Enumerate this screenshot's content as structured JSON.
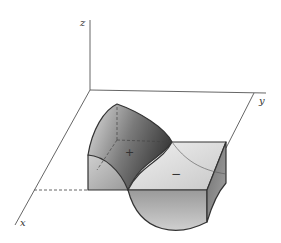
{
  "figure": {
    "axes": {
      "x_label": "x",
      "y_label": "y",
      "z_label": "z"
    },
    "regions": {
      "positive_label": "+",
      "negative_label": "−"
    },
    "colors": {
      "line": "#333333",
      "axis": "#555555",
      "light_face": "#d9d9d9",
      "mid_face": "#a8a8a8",
      "dark_face": "#5a5a5a"
    }
  }
}
